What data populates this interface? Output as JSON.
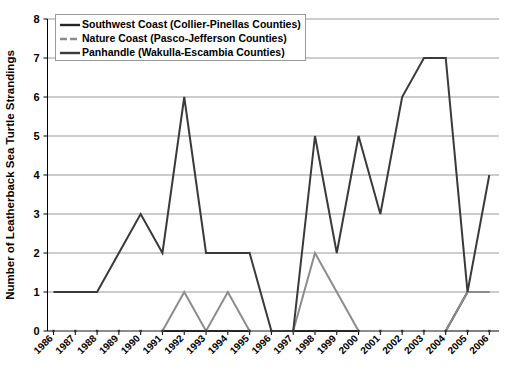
{
  "chart_data": {
    "type": "line",
    "title": "",
    "xlabel": "",
    "ylabel": "Number of Leatherback Sea Turtle Strandings",
    "x": [
      "1986",
      "1987",
      "1988",
      "1989",
      "1990",
      "1991",
      "1992",
      "1993",
      "1994",
      "1995",
      "1996",
      "1997",
      "1998",
      "1999",
      "2000",
      "2001",
      "2002",
      "2003",
      "2004",
      "2005",
      "2006"
    ],
    "ylim": [
      0,
      8
    ],
    "yticks": [
      0,
      1,
      2,
      3,
      4,
      5,
      6,
      7,
      8
    ],
    "grid": true,
    "legend_position": "top-left",
    "series": [
      {
        "name": "Southwest Coast (Collier-Pinellas Counties)",
        "color": "#262626",
        "values": [
          0,
          0,
          0,
          0,
          0,
          0,
          0,
          0,
          0,
          0,
          0,
          0,
          0,
          0,
          0,
          0,
          0,
          0,
          0,
          1,
          1
        ]
      },
      {
        "name": "Nature Coast (Pasco-Jefferson Counties)",
        "color": "#8c8c8c",
        "values": [
          0,
          0,
          0,
          0,
          0,
          0,
          1,
          0,
          1,
          0,
          0,
          0,
          2,
          1,
          0,
          0,
          0,
          0,
          0,
          1,
          1
        ]
      },
      {
        "name": "Panhandle (Wakulla-Escambia Counties)",
        "color": "#3a3a3a",
        "values": [
          1,
          1,
          1,
          2,
          3,
          2,
          6,
          2,
          2,
          2,
          0,
          0,
          5,
          2,
          5,
          3,
          6,
          7,
          7,
          1,
          4
        ]
      }
    ]
  },
  "legend": {
    "items": [
      {
        "label": "Southwest Coast (Collier-Pinellas Counties)",
        "color": "#262626",
        "icon": "line-swatch-solid"
      },
      {
        "label": "Nature Coast (Pasco-Jefferson Counties)",
        "color": "#8c8c8c",
        "icon": "line-swatch-dashed"
      },
      {
        "label": "Panhandle (Wakulla-Escambia Counties)",
        "color": "#3a3a3a",
        "icon": "line-swatch-solid"
      }
    ]
  },
  "axes": {
    "y_label": "Number of Leatherback Sea Turtle Strandings",
    "y_ticks": [
      "0",
      "1",
      "2",
      "3",
      "4",
      "5",
      "6",
      "7",
      "8"
    ],
    "x_ticks": [
      "1986",
      "1987",
      "1988",
      "1989",
      "1990",
      "1991",
      "1992",
      "1993",
      "1994",
      "1995",
      "1996",
      "1997",
      "1998",
      "1999",
      "2000",
      "2001",
      "2002",
      "2003",
      "2004",
      "2005",
      "2006"
    ]
  }
}
